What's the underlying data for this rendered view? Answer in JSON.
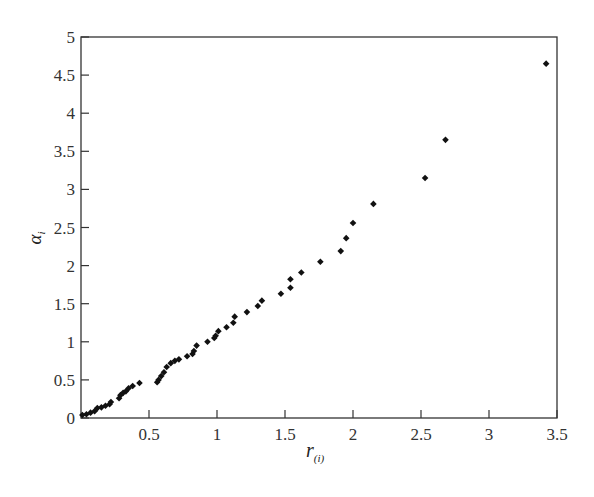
{
  "chart_data": {
    "type": "scatter",
    "title": "",
    "xlabel": "r_(i)",
    "xlabel_main": "r",
    "xlabel_sub": "(i)",
    "ylabel": "α_i",
    "ylabel_main": "α",
    "ylabel_sub": "i",
    "xlim": [
      0,
      3.5
    ],
    "ylim": [
      0,
      5
    ],
    "xticks": [
      0.5,
      1,
      1.5,
      2,
      2.5,
      3,
      3.5
    ],
    "xtick_labels": [
      "0.5",
      "1",
      "1.5",
      "2",
      "2.5",
      "3",
      "3.5"
    ],
    "yticks": [
      0,
      0.5,
      1,
      1.5,
      2,
      2.5,
      3,
      3.5,
      4,
      4.5,
      5
    ],
    "ytick_labels": [
      "0",
      "0.5",
      "1",
      "1.5",
      "2",
      "2.5",
      "3",
      "3.5",
      "4",
      "4.5",
      "5"
    ],
    "grid": false,
    "legend": null,
    "marker": "diamond",
    "marker_color": "#111111",
    "series": [
      {
        "name": "data",
        "points": [
          [
            0.01,
            0.04
          ],
          [
            0.04,
            0.05
          ],
          [
            0.07,
            0.07
          ],
          [
            0.1,
            0.09
          ],
          [
            0.12,
            0.13
          ],
          [
            0.15,
            0.14
          ],
          [
            0.18,
            0.16
          ],
          [
            0.21,
            0.18
          ],
          [
            0.22,
            0.21
          ],
          [
            0.28,
            0.26
          ],
          [
            0.29,
            0.3
          ],
          [
            0.31,
            0.33
          ],
          [
            0.33,
            0.35
          ],
          [
            0.35,
            0.39
          ],
          [
            0.38,
            0.42
          ],
          [
            0.43,
            0.46
          ],
          [
            0.56,
            0.47
          ],
          [
            0.57,
            0.5
          ],
          [
            0.59,
            0.55
          ],
          [
            0.61,
            0.6
          ],
          [
            0.63,
            0.67
          ],
          [
            0.66,
            0.72
          ],
          [
            0.69,
            0.75
          ],
          [
            0.72,
            0.77
          ],
          [
            0.78,
            0.81
          ],
          [
            0.82,
            0.84
          ],
          [
            0.83,
            0.88
          ],
          [
            0.85,
            0.95
          ],
          [
            0.93,
            1.0
          ],
          [
            0.98,
            1.05
          ],
          [
            0.99,
            1.08
          ],
          [
            1.01,
            1.14
          ],
          [
            1.07,
            1.19
          ],
          [
            1.12,
            1.25
          ],
          [
            1.13,
            1.33
          ],
          [
            1.22,
            1.39
          ],
          [
            1.3,
            1.47
          ],
          [
            1.33,
            1.54
          ],
          [
            1.47,
            1.63
          ],
          [
            1.54,
            1.71
          ],
          [
            1.54,
            1.82
          ],
          [
            1.62,
            1.91
          ],
          [
            1.76,
            2.05
          ],
          [
            1.91,
            2.19
          ],
          [
            1.95,
            2.36
          ],
          [
            2.0,
            2.56
          ],
          [
            2.15,
            2.81
          ],
          [
            2.53,
            3.15
          ],
          [
            2.68,
            3.65
          ],
          [
            3.42,
            4.65
          ]
        ]
      }
    ]
  },
  "layout": {
    "plot_left": 81,
    "plot_top": 37,
    "plot_right": 557,
    "plot_bottom": 418
  }
}
